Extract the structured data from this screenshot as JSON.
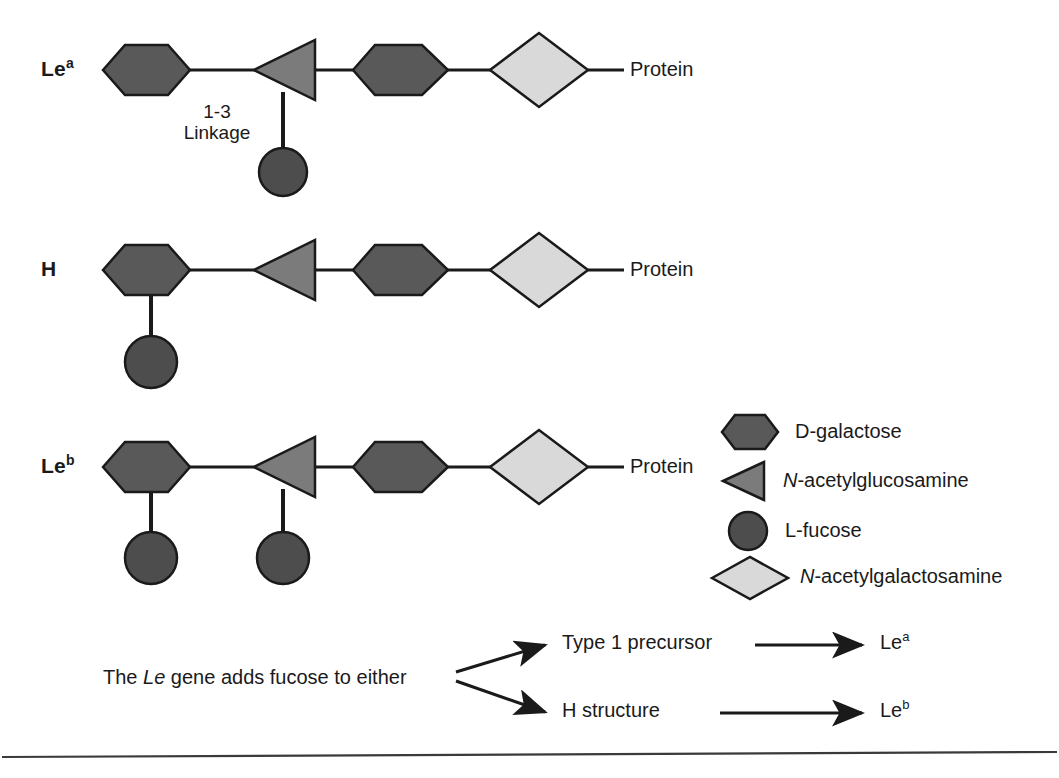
{
  "figure": {
    "bottom_rule": true
  },
  "rows": [
    {
      "id": "lewis-a",
      "label_base": "Le",
      "label_sup": "a",
      "protein_label": "Protein",
      "linkage_line1": "1-3",
      "linkage_line2": "Linkage",
      "fucose_count": 1,
      "fucose_attachment": "n-acetylglucosamine"
    },
    {
      "id": "h-antigen",
      "label_base": "H",
      "label_sup": "",
      "protein_label": "Protein",
      "linkage_line1": "",
      "linkage_line2": "",
      "fucose_count": 1,
      "fucose_attachment": "d-galactose"
    },
    {
      "id": "lewis-b",
      "label_base": "Le",
      "label_sup": "b",
      "protein_label": "Protein",
      "linkage_line1": "",
      "linkage_line2": "",
      "fucose_count": 2,
      "fucose_attachment": "both"
    }
  ],
  "legend": {
    "items": [
      {
        "shape": "hexagon",
        "label": "D-galactose",
        "italic_prefix": "",
        "color": "#595959"
      },
      {
        "shape": "triangle",
        "label": "-acetylglucosamine",
        "italic_prefix": "N",
        "color": "#7b7b7b"
      },
      {
        "shape": "circle",
        "label": "L-fucose",
        "italic_prefix": "",
        "color": "#4d4d4d"
      },
      {
        "shape": "diamond",
        "label": "-acetylgalactosamine",
        "italic_prefix": "N",
        "color": "#d9d9d9"
      }
    ]
  },
  "flow": {
    "source_prefix": "The ",
    "source_italic": "Le",
    "source_suffix": " gene adds fucose to either",
    "branches": [
      {
        "from_label": "Type 1 precursor",
        "to_base": "Le",
        "to_sup": "a"
      },
      {
        "from_label": "H structure",
        "to_base": "Le",
        "to_sup": "b"
      }
    ]
  },
  "colors": {
    "galactose": "#595959",
    "glcnac": "#7b7b7b",
    "fucose": "#4d4d4d",
    "galnac": "#d9d9d9",
    "stroke": "#1a1a1a",
    "background": "#ffffff"
  }
}
